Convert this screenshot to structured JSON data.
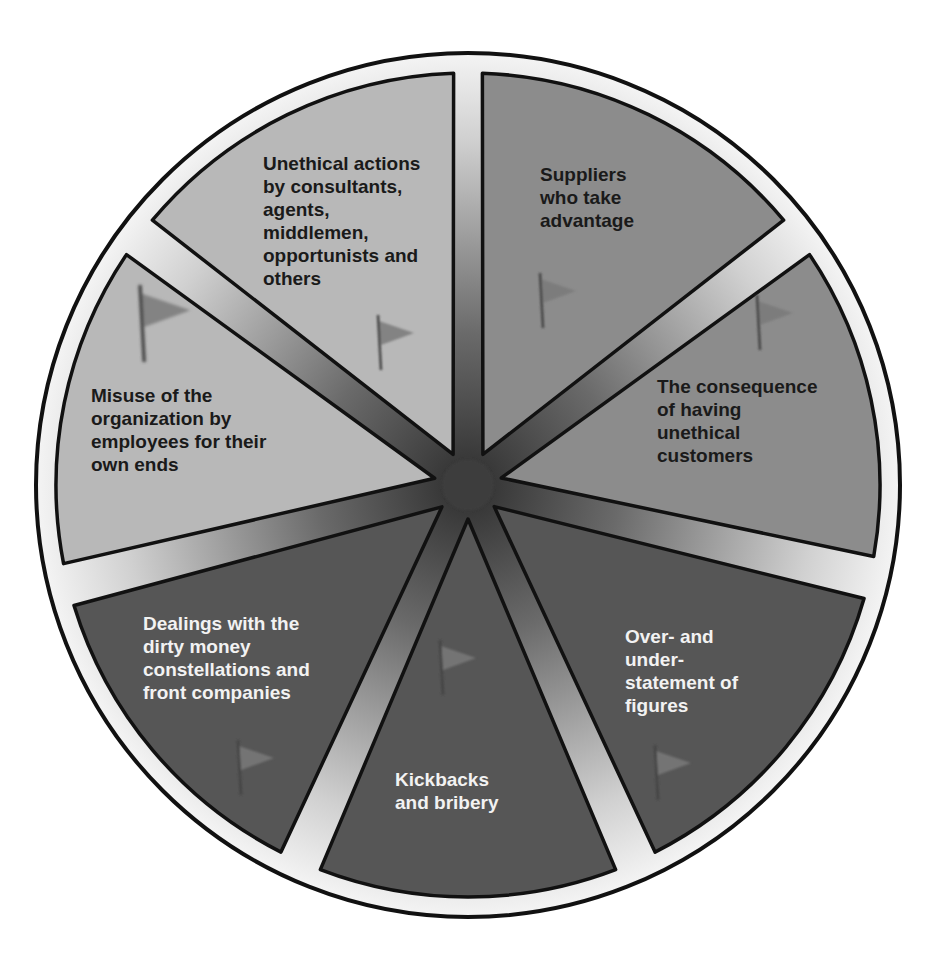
{
  "diagram": {
    "type": "segmented-wheel",
    "title_cutoff": "",
    "center": {
      "x": 468,
      "y": 485
    },
    "outer_radius": 432,
    "ring_inner_radius": 412,
    "gap_width": 24,
    "colors": {
      "outer_ring": "#e8e8e8",
      "outline": "#111111",
      "hub": "#3c3c3c",
      "light": "#b8b8b8",
      "medium": "#8c8c8c",
      "dark": "#565656",
      "flag": "#7a7a7a"
    },
    "segments": [
      {
        "id": "suppliers",
        "label": "Suppliers\nwho take\nadvantage",
        "start": 2,
        "end": 50,
        "shade": "medium",
        "text_color": "#1a1a1a",
        "label_pos": {
          "x": 540,
          "y": 163
        },
        "flag": {
          "x": 540,
          "y": 273,
          "size": 1
        }
      },
      {
        "id": "unethical-customers",
        "label": "The consequence\nof having\nunethical\ncustomers",
        "start": 56,
        "end": 100,
        "shade": "medium",
        "text_color": "#1a1a1a",
        "label_pos": {
          "x": 657,
          "y": 375
        },
        "flag": {
          "x": 757,
          "y": 295,
          "size": 1
        }
      },
      {
        "id": "over-under-statement",
        "label": "Over- and\nunder-\nstatement of\nfigures",
        "start": 106,
        "end": 153,
        "shade": "dark",
        "text_color": "#f2f2f2",
        "label_pos": {
          "x": 625,
          "y": 625
        },
        "flag": {
          "x": 655,
          "y": 745,
          "size": 1
        }
      },
      {
        "id": "kickbacks",
        "label": "Kickbacks\nand bribery",
        "start": 159,
        "end": 201,
        "shade": "dark",
        "text_color": "#f2f2f2",
        "label_pos": {
          "x": 395,
          "y": 768
        },
        "flag": {
          "x": 440,
          "y": 640,
          "size": 1
        }
      },
      {
        "id": "dirty-money",
        "label": "Dealings with the\ndirty money\nconstellations and\nfront companies",
        "start": 207,
        "end": 253,
        "shade": "dark",
        "text_color": "#f2f2f2",
        "label_pos": {
          "x": 143,
          "y": 612
        },
        "flag": {
          "x": 238,
          "y": 740,
          "size": 1
        }
      },
      {
        "id": "employee-misuse",
        "label": "Misuse of the\norganization by\nemployees for their\nown ends",
        "start": 259,
        "end": 304,
        "shade": "light",
        "text_color": "#1a1a1a",
        "label_pos": {
          "x": 91,
          "y": 384
        },
        "flag": {
          "x": 140,
          "y": 285,
          "size": 1.4
        }
      },
      {
        "id": "third-party-actions",
        "label": "Unethical actions\nby consultants,\nagents,\nmiddlemen,\nopportunists and\nothers",
        "start": 310,
        "end": 358,
        "shade": "light",
        "text_color": "#1a1a1a",
        "label_pos": {
          "x": 263,
          "y": 152
        },
        "flag": {
          "x": 378,
          "y": 315,
          "size": 1
        }
      }
    ]
  }
}
